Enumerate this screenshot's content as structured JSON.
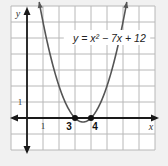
{
  "chart_data": {
    "type": "line",
    "title": "",
    "equation_label": "y = x² − 7x + 12",
    "function": {
      "a": 1,
      "b": -7,
      "c": 12
    },
    "xlabel": "x",
    "ylabel": "y",
    "xlim": [
      -1,
      8
    ],
    "ylim": [
      -2,
      7
    ],
    "grid": true,
    "x_tick_labels": [
      {
        "value": 1,
        "label": "1"
      }
    ],
    "y_tick_labels": [
      {
        "value": 1,
        "label": "1"
      }
    ],
    "points": [
      {
        "x": 3,
        "y": 0,
        "label": "3"
      },
      {
        "x": 4,
        "y": 0,
        "label": "4"
      }
    ],
    "vertex": {
      "x": 3.5,
      "y": -0.25
    }
  },
  "colors": {
    "background": "#f1f1f1",
    "plot_bg": "#ffffff",
    "grid": "#b8b8b8",
    "axis": "#1a1a1a",
    "curve": "#555555",
    "point": "#111111"
  }
}
